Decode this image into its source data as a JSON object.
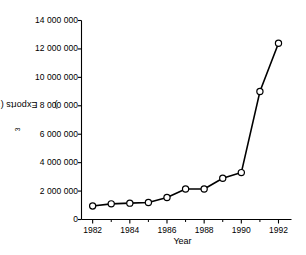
{
  "chart_data": {
    "type": "line",
    "title": "",
    "xlabel": "Year",
    "ylabel": "Exports (×10³)",
    "ylabel_base": "Exports (×10",
    "ylabel_exp": "3",
    "ylabel_tail": ")",
    "x": [
      1982,
      1983,
      1984,
      1985,
      1986,
      1987,
      1988,
      1989,
      1990,
      1991,
      1992
    ],
    "values": [
      950000,
      1100000,
      1150000,
      1200000,
      1550000,
      2150000,
      2150000,
      2900000,
      3300000,
      9000000,
      12400000
    ],
    "series": [
      {
        "name": "Exports",
        "values": [
          950000,
          1100000,
          1150000,
          1200000,
          1550000,
          2150000,
          2150000,
          2900000,
          3300000,
          9000000,
          12400000
        ]
      }
    ],
    "xlim": [
      1981.4,
      1992.7
    ],
    "ylim": [
      0,
      14000000
    ],
    "grid": false,
    "legend": false,
    "legend_position": "none",
    "marker": "open-circle",
    "line_color": "#000000",
    "marker_face_color": "#ffffff",
    "marker_edge_color": "#000000",
    "ytick_values": [
      0,
      2000000,
      4000000,
      6000000,
      8000000,
      10000000,
      12000000,
      14000000
    ],
    "ytick_labels": [
      "0",
      "2 000 000",
      "4 000 000",
      "6 000 000",
      "8 000 000",
      "10 000 000",
      "12 000 000",
      "14 000 000"
    ],
    "xtick_values": [
      1982,
      1984,
      1986,
      1988,
      1990,
      1992
    ],
    "xtick_labels": [
      "1982",
      "1984",
      "1986",
      "1988",
      "1990",
      "1992"
    ],
    "xtick_minor_values": [
      1983,
      1985,
      1987,
      1989,
      1991
    ]
  }
}
